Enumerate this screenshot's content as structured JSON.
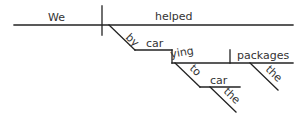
{
  "diagram": {
    "type": "Reed-Kellogg sentence diagram",
    "sentence_words": {
      "subject": "We",
      "verb": "helped",
      "preposition": "by",
      "gerund_part1": "car",
      "gerund_part2": "ying",
      "infinitive_to": "to",
      "infinitive_verb": "car",
      "article_1": "the",
      "direct_object": "packages",
      "article_2": "the"
    },
    "colors": {
      "line": "#222222",
      "text": "#333333",
      "background": "#ffffff"
    }
  }
}
